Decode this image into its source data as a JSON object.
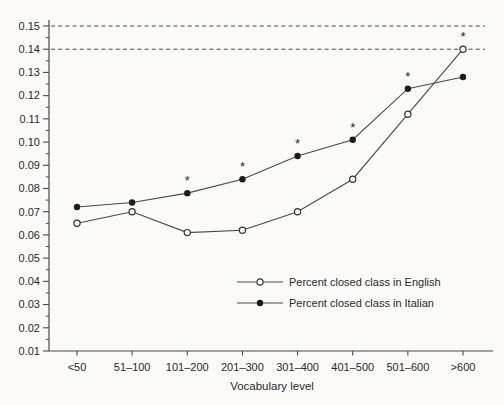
{
  "figure": {
    "background_color": "#fbfaf7",
    "line_color": "#4a4a4a",
    "text_color": "#2a2a2a",
    "marker_fill_open": "#fbfaf7",
    "marker_fill_solid": "#1d1d1d",
    "marker_stroke": "#333333"
  },
  "chart_data": {
    "type": "line",
    "title": "",
    "xlabel": "Vocabulary level",
    "ylabel": "",
    "categories": [
      "<50",
      "51–100",
      "101–200",
      "201–300",
      "301–400",
      "401–500",
      "501–600",
      ">600"
    ],
    "y_tick_labels": [
      "0.15",
      "0.14",
      "0.13",
      "0.12",
      "0.11",
      "0.10",
      "0.09",
      "0.08",
      "0.07",
      "0.06",
      "0.05",
      "0.04",
      "0.03",
      "0.02",
      "0.01"
    ],
    "ylim": [
      0.01,
      0.15
    ],
    "grid": false,
    "legend_position": "inside-lower-right",
    "reference_lines": [
      {
        "value": 0.15,
        "style": "dashed"
      },
      {
        "value": 0.14,
        "style": "dashed"
      }
    ],
    "series": [
      {
        "name": "Percent closed class in English",
        "marker": "open-circle",
        "values": [
          0.065,
          0.07,
          0.061,
          0.062,
          0.07,
          0.084,
          0.112,
          0.14
        ]
      },
      {
        "name": "Percent closed class in Italian",
        "marker": "filled-circle",
        "values": [
          0.072,
          0.074,
          0.078,
          0.084,
          0.094,
          0.101,
          0.123,
          0.128
        ]
      }
    ],
    "significance_marks": [
      {
        "symbol": "*",
        "series": "Percent closed class in Italian",
        "category": "101–200"
      },
      {
        "symbol": "*",
        "series": "Percent closed class in Italian",
        "category": "201–300"
      },
      {
        "symbol": "*",
        "series": "Percent closed class in Italian",
        "category": "301–400"
      },
      {
        "symbol": "*",
        "series": "Percent closed class in Italian",
        "category": "401–500"
      },
      {
        "symbol": "*",
        "series": "Percent closed class in Italian",
        "category": "501–600"
      },
      {
        "symbol": "*",
        "series": "Percent closed class in English",
        "category": ">600"
      }
    ]
  }
}
